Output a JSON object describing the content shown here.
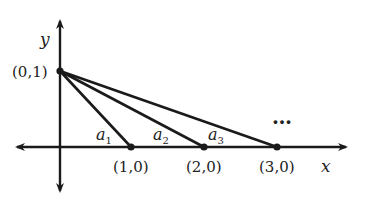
{
  "axes": {
    "x_label": "x",
    "y_label": "y"
  },
  "points": {
    "apex": {
      "label": "(0,1)"
    },
    "p1": {
      "label": "(1,0)"
    },
    "p2": {
      "label": "(2,0)"
    },
    "p3": {
      "label": "(3,0)"
    }
  },
  "segments": [
    {
      "label": "a",
      "subscript": "1"
    },
    {
      "label": "a",
      "subscript": "2"
    },
    {
      "label": "a",
      "subscript": "3"
    }
  ],
  "ellipsis": "…",
  "colors": {
    "stroke": "#1a1a1a",
    "text": "#222222"
  }
}
